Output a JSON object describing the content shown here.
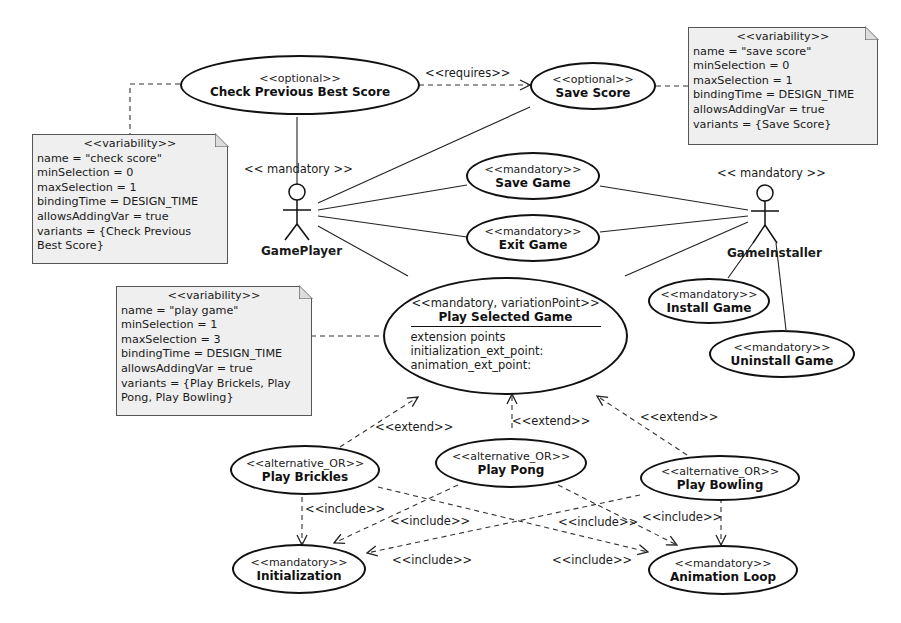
{
  "diagram": {
    "type": "UML use case diagram with variability",
    "actors": [
      {
        "id": "gameplayer",
        "stereotype": "<< mandatory >>",
        "name": "GamePlayer"
      },
      {
        "id": "gameinstaller",
        "stereotype": "<< mandatory >>",
        "name": "GameInstaller"
      }
    ],
    "usecases": {
      "check_previous_best_score": {
        "stereotype": "<<optional>>",
        "name": "Check Previous Best Score"
      },
      "save_score": {
        "stereotype": "<<optional>>",
        "name": "Save Score"
      },
      "save_game": {
        "stereotype": "<<mandatory>>",
        "name": "Save Game"
      },
      "exit_game": {
        "stereotype": "<<mandatory>>",
        "name": "Exit Game"
      },
      "play_selected_game": {
        "stereotype": "<<mandatory, variationPoint>>",
        "name": "Play Selected Game",
        "extension_points_label": "extension points",
        "extension_points": [
          "initialization_ext_point:",
          "animation_ext_point:"
        ]
      },
      "install_game": {
        "stereotype": "<<mandatory>>",
        "name": "Install Game"
      },
      "uninstall_game": {
        "stereotype": "<<mandatory>>",
        "name": "Uninstall Game"
      },
      "play_brickles": {
        "stereotype": "<<alternative_OR>>",
        "name": "Play Brickles"
      },
      "play_pong": {
        "stereotype": "<<alternative_OR>>",
        "name": "Play Pong"
      },
      "play_bowling": {
        "stereotype": "<<alternative_OR>>",
        "name": "Play Bowling"
      },
      "initialization": {
        "stereotype": "<<mandatory>>",
        "name": "Initialization"
      },
      "animation_loop": {
        "stereotype": "<<mandatory>>",
        "name": "Animation Loop"
      }
    },
    "notes": {
      "check_score": {
        "title": "<<variability>>",
        "lines": [
          "name = \"check score\"",
          "minSelection = 0",
          "maxSelection = 1",
          "bindingTime = DESIGN_TIME",
          "allowsAddingVar = true",
          "variants = {Check Previous",
          "Best Score}"
        ]
      },
      "save_score": {
        "title": "<<variability>>",
        "lines": [
          "name = \"save score\"",
          "minSelection = 0",
          "maxSelection = 1",
          "bindingTime = DESIGN_TIME",
          "allowsAddingVar = true",
          "variants = {Save Score}"
        ]
      },
      "play_game": {
        "title": "<<variability>>",
        "lines": [
          "name = \"play game\"",
          "minSelection = 1",
          "maxSelection = 3",
          "bindingTime = DESIGN_TIME",
          "allowsAddingVar = true",
          "variants = {Play Brickels, Play",
          "Pong, Play Bowling}"
        ]
      }
    },
    "relation_labels": {
      "requires": "<<requires>>",
      "extend": "<<extend>>",
      "include": "<<include>>"
    }
  }
}
